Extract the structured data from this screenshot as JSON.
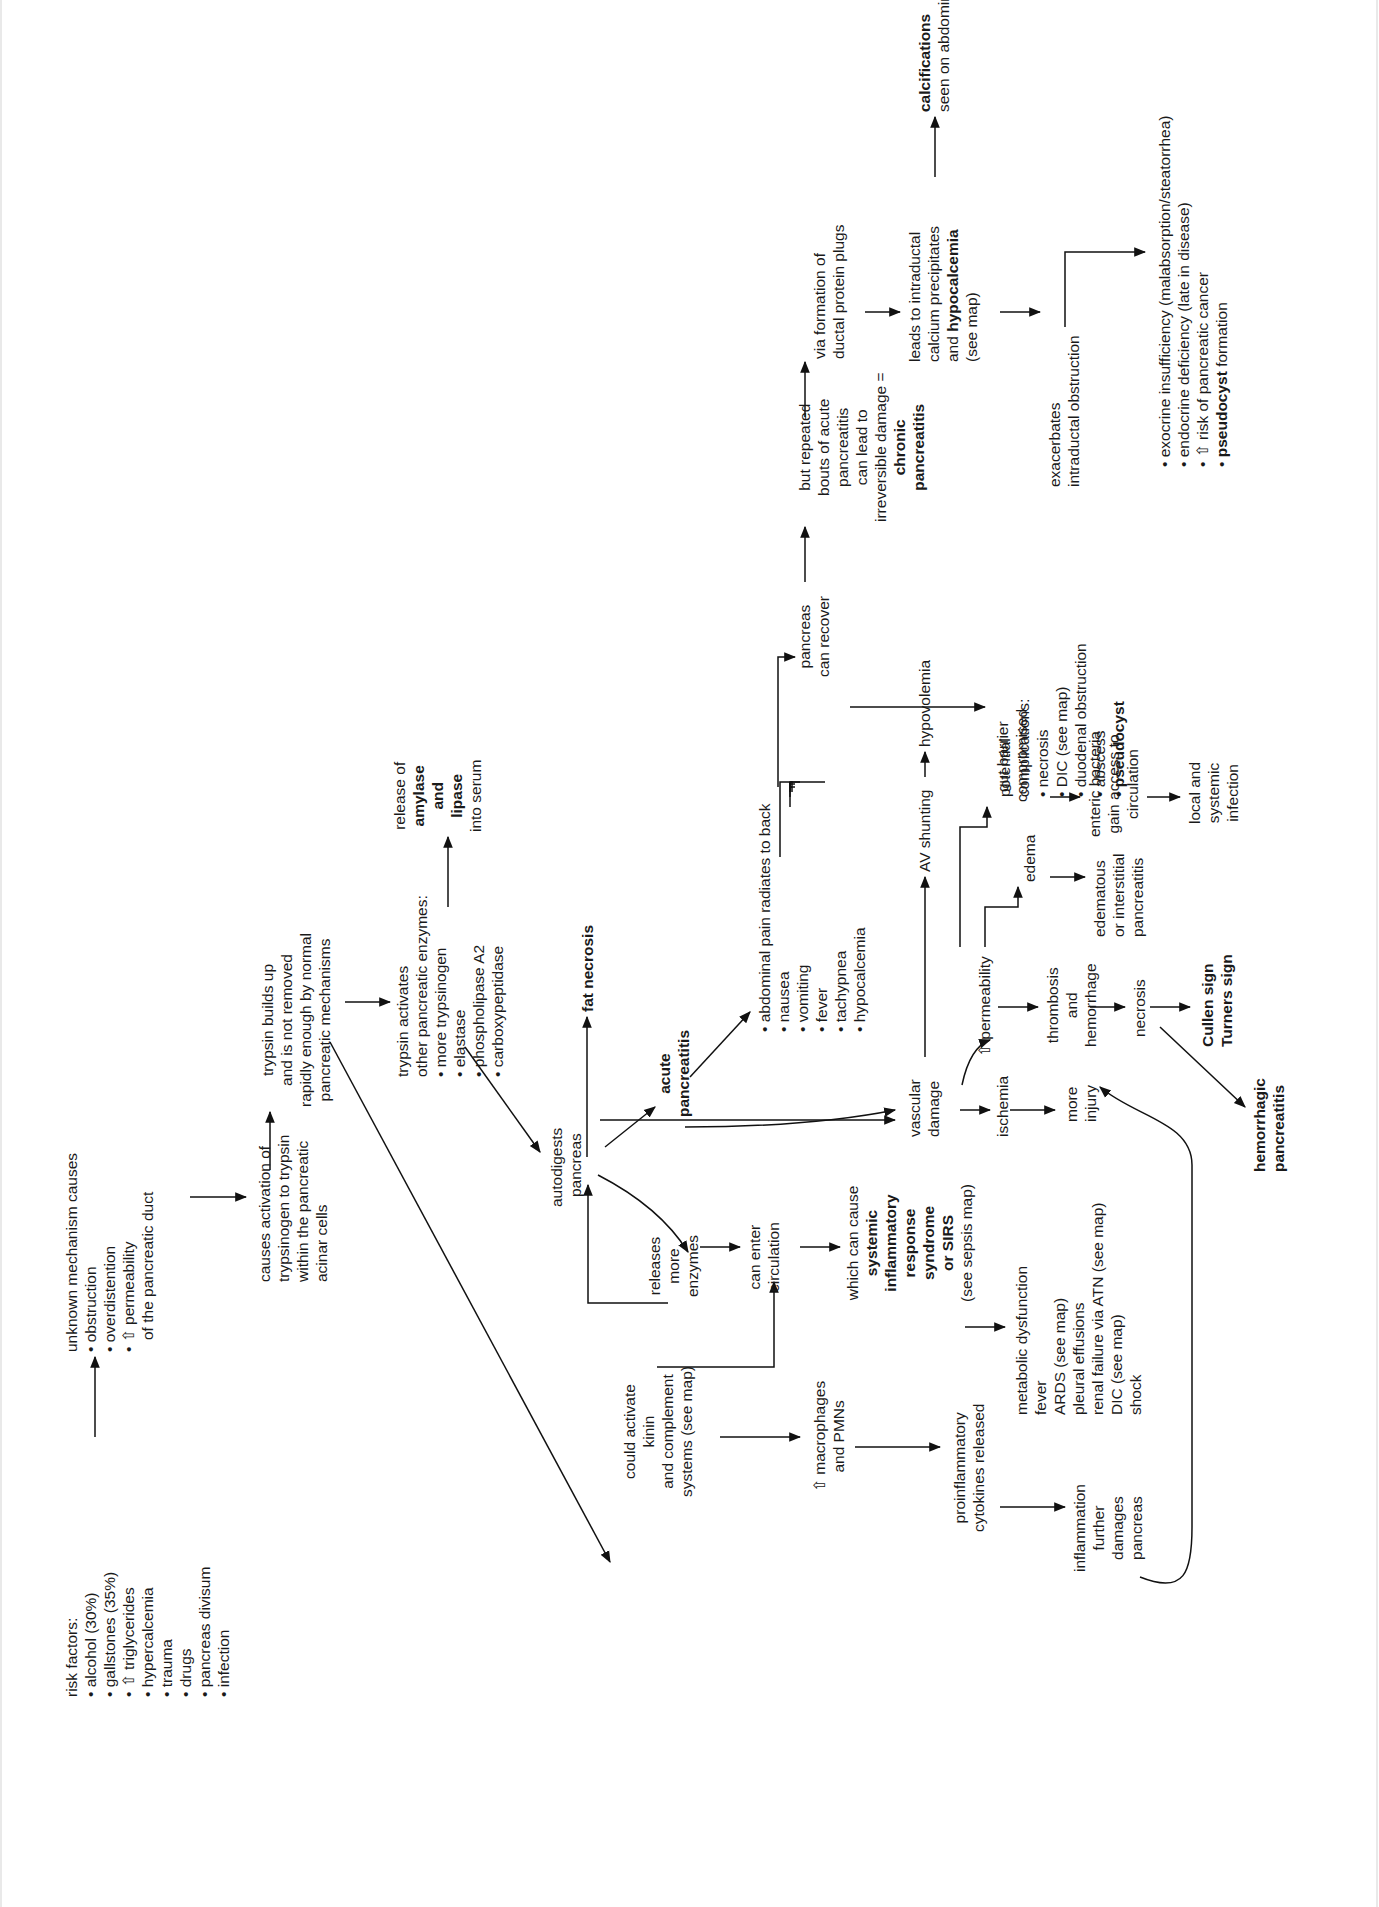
{
  "diagram": {
    "orientation": "rotated -90deg (text reads bottom-to-top)",
    "nodes": {
      "risk_factors": {
        "title": "risk factors:",
        "items": [
          "alcohol (30%)",
          "gallstones (35%)",
          "⇧ triglycerides",
          "hypercalcemia",
          "trauma",
          "drugs",
          "pancreas divisum",
          "infection"
        ]
      },
      "unknown_mechanism": {
        "title": "unknown mechanism causes",
        "items": [
          "obstruction",
          "overdistention",
          "⇧ permeability"
        ],
        "continuation": "of the pancreatic duct"
      },
      "causes_activation": {
        "lines": [
          "causes activation of",
          "trypsinogen to trypsin",
          "within the pancreatic",
          "acinar cells"
        ]
      },
      "trypsin_builds": {
        "lines": [
          "trypsin builds up",
          "and is not removed",
          "rapidly enough by normal",
          "pancreatic mechanisms"
        ]
      },
      "trypsin_activates": {
        "lines": [
          "trypsin activates",
          "other pancreatic enzymes:"
        ],
        "items": [
          "more trypsinogen",
          "elastase",
          "phospholipase A2",
          "carboxypeptidase"
        ]
      },
      "release_amylase": {
        "line1": "release of",
        "bold1": "amylase",
        "bold2": "and",
        "bold3": "lipase",
        "line2": "into serum"
      },
      "autodigests": {
        "lines": [
          "autodigests",
          "pancreas"
        ]
      },
      "fat_necrosis": {
        "label": "fat necrosis"
      },
      "acute_pancreatitis": {
        "lines": [
          "acute",
          "pancreatitis"
        ]
      },
      "symptoms": {
        "items": [
          "abdominal pain radiates to back",
          "nausea",
          "vomiting",
          "fever",
          "tachypnea",
          "hypocalcemia"
        ]
      },
      "pancreas_recover": {
        "lines": [
          "pancreas",
          "can recover"
        ]
      },
      "repeated_bouts": {
        "lines": [
          "but repeated",
          "bouts of acute",
          "pancreatitis",
          "can lead to",
          "irreversible damage ="
        ],
        "bold_lines": [
          "chronic",
          "pancreatitis"
        ]
      },
      "protein_plugs": {
        "lines": [
          "via formation of",
          "ductal protein plugs"
        ]
      },
      "intraductal_calcium": {
        "lines": [
          "leads to intraductal",
          "calcium precipitates"
        ],
        "line3_prefix": "and ",
        "line3_bold": "hypocalcemia",
        "line4": "(see map)"
      },
      "calcifications": {
        "bold": "calcifications",
        "line": "seen on abdominal x-ray"
      },
      "exacerbates": {
        "lines": [
          "exacerbates",
          "intraductal obstruction"
        ]
      },
      "chronic_outcomes": {
        "items": [
          "exocrine insufficiency (malabsorption/steatorrhea)",
          "endocrine deficiency (late in disease)",
          "⇧ risk of pancreatic cancer"
        ],
        "last_bold": "pseudocyst",
        "last_rest": " formation"
      },
      "potential_complications": {
        "lines": [
          "potential",
          "complications:"
        ],
        "items": [
          "necrosis",
          "DIC (see map)",
          "duodenal obstruction",
          "abscess"
        ],
        "last_bold": "pseudocyst"
      },
      "vascular_damage": {
        "lines": [
          "vascular",
          "damage"
        ]
      },
      "av_shunting": {
        "label": "AV shunting"
      },
      "hypovolemia": {
        "label": "hypovolemia"
      },
      "permeability": {
        "label": "⇧ permeability"
      },
      "edema": {
        "label": "edema"
      },
      "edematous": {
        "lines": [
          "edematous",
          "or interstitial",
          "pancreatitis"
        ]
      },
      "gut_barrier": {
        "lines": [
          "gut barrier",
          "compromised"
        ]
      },
      "enteric_bacteria": {
        "lines": [
          "enteric bacteria",
          "gain access to",
          "circulation"
        ]
      },
      "local_systemic": {
        "lines": [
          "local and",
          "systemic",
          "infection"
        ]
      },
      "thrombosis": {
        "lines": [
          "thrombosis",
          "and",
          "hemorrhage"
        ]
      },
      "necrosis": {
        "label": "necrosis"
      },
      "cullen": {
        "lines": [
          "Cullen sign",
          "Turners sign"
        ]
      },
      "hemorrhagic": {
        "lines": [
          "hemorrhagic",
          "pancreatitis"
        ]
      },
      "ischemia": {
        "label": "ischemia"
      },
      "more_injury": {
        "lines": [
          "more",
          "injury"
        ]
      },
      "releases_enzymes": {
        "lines": [
          "releases",
          "more",
          "enzymes"
        ]
      },
      "enter_circulation": {
        "lines": [
          "can enter",
          "circulation"
        ]
      },
      "sirs": {
        "line1": "which can cause",
        "bold_lines": [
          "systemic",
          "inflammatory",
          "response",
          "syndrome",
          "or SIRS"
        ],
        "line2": "(see sepsis map)"
      },
      "sirs_effects": {
        "lines": [
          "metabolic dysfunction",
          "fever",
          "ARDS (see map)",
          "pleural effusions",
          "renal failure via ATN (see map)",
          "DIC (see map)",
          "shock"
        ]
      },
      "kinin": {
        "lines": [
          "could activate",
          "kinin",
          "and complement",
          "systems (see map)"
        ]
      },
      "macrophages": {
        "lines": [
          "⇧ macrophages",
          "and PMNs"
        ]
      },
      "cytokines": {
        "lines": [
          "proinflammatory",
          "cytokines released"
        ]
      },
      "inflammation": {
        "lines": [
          "inflammation",
          "further",
          "damages",
          "pancreas"
        ]
      }
    }
  }
}
